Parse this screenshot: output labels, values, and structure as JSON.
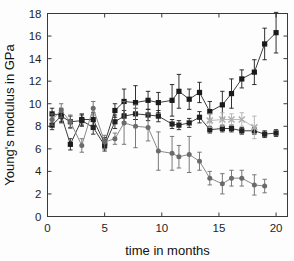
{
  "chart_data": {
    "type": "line",
    "title": "",
    "subtitle": "",
    "xlabel": "time in months",
    "ylabel": "Young's modulus in GPa",
    "xlim": [
      0,
      21
    ],
    "ylim": [
      0,
      18
    ],
    "xticks": [
      0,
      5,
      10,
      15,
      20
    ],
    "yticks": [
      0,
      2,
      4,
      6,
      8,
      10,
      12,
      14,
      16,
      18
    ],
    "xtick_labels": [
      "0",
      "5",
      "10",
      "15",
      "20"
    ],
    "ytick_labels": [
      "0",
      "2",
      "4",
      "6",
      "8",
      "10",
      "12",
      "14",
      "16",
      "18"
    ],
    "grid": false,
    "legend": "none",
    "error_bars": "symmetric vertical",
    "series": [
      {
        "name": "series-black-squares-upper",
        "marker": "square",
        "color": "#1a1a1a",
        "line_color": "#3d3d3d",
        "x": [
          0.4,
          1.2,
          2.0,
          3.0,
          4.0,
          5.0,
          5.9,
          6.7,
          7.7,
          8.8,
          9.7,
          10.9,
          11.5,
          12.4,
          13.3,
          14.2,
          15.3,
          16.1,
          17.0,
          18.1,
          19.0,
          20.0
        ],
        "y": [
          9.1,
          9.0,
          6.4,
          8.6,
          8.6,
          6.5,
          9.4,
          10.2,
          10.1,
          10.3,
          10.1,
          10.3,
          11.1,
          10.4,
          11.0,
          9.3,
          9.9,
          10.9,
          12.2,
          12.8,
          15.3,
          16.3
        ],
        "yerr": [
          0.5,
          0.6,
          0.5,
          0.5,
          0.6,
          0.5,
          0.6,
          1.1,
          1.5,
          0.8,
          0.9,
          1.4,
          1.5,
          0.9,
          0.9,
          0.9,
          1.2,
          1.3,
          0.8,
          1.1,
          1.4,
          1.8
        ]
      },
      {
        "name": "series-black-squares-flat",
        "marker": "square",
        "color": "#222222",
        "line_color": "#3d3d3d",
        "x": [
          0.4,
          1.2,
          2.0,
          3.0,
          4.0,
          5.0,
          5.9,
          6.7,
          7.7,
          8.8,
          9.7,
          10.9,
          11.5,
          12.4,
          13.3,
          14.2,
          15.3,
          16.1,
          17.0,
          18.1,
          19.0,
          20.0
        ],
        "y": [
          8.1,
          8.9,
          8.4,
          8.5,
          7.9,
          6.3,
          8.4,
          8.9,
          9.1,
          9.0,
          8.9,
          8.2,
          8.1,
          8.3,
          8.8,
          7.7,
          7.8,
          7.8,
          7.6,
          7.6,
          7.3,
          7.4
        ],
        "yerr": [
          0.4,
          0.6,
          0.5,
          0.5,
          0.6,
          0.5,
          0.6,
          0.5,
          0.5,
          0.5,
          0.5,
          0.4,
          0.4,
          0.4,
          0.5,
          0.3,
          0.3,
          0.3,
          0.3,
          0.3,
          0.3,
          0.3
        ]
      },
      {
        "name": "series-gray-circles-descending",
        "marker": "circle",
        "color": "#6b6b6b",
        "line_color": "#8a8a8a",
        "x": [
          0.4,
          1.2,
          2.0,
          3.0,
          4.0,
          5.0,
          5.9,
          6.7,
          7.7,
          8.8,
          9.7,
          10.9,
          11.5,
          12.4,
          13.3,
          14.2,
          15.3,
          16.1,
          17.0,
          18.1,
          19.0
        ],
        "y": [
          8.6,
          9.4,
          8.4,
          6.3,
          9.6,
          6.6,
          6.9,
          8.3,
          8.0,
          7.9,
          5.8,
          5.6,
          5.3,
          5.5,
          4.9,
          3.4,
          2.9,
          3.4,
          3.4,
          2.8,
          2.7
        ],
        "yerr": [
          0.5,
          0.6,
          0.6,
          0.6,
          0.6,
          0.6,
          0.5,
          1.9,
          1.9,
          1.2,
          1.7,
          1.5,
          1.0,
          1.6,
          0.8,
          0.6,
          0.9,
          0.7,
          0.7,
          0.9,
          0.6
        ]
      },
      {
        "name": "series-light-gray-crosses",
        "marker": "cross",
        "color": "#b0b0b0",
        "line_color": "#bdbdbd",
        "x": [
          14.2,
          15.3,
          16.1,
          17.0,
          18.1
        ],
        "y": [
          8.5,
          8.6,
          8.6,
          8.6,
          7.9
        ],
        "yerr": [
          0.6,
          0.6,
          0.5,
          0.6,
          1.0
        ]
      }
    ]
  },
  "axes": {
    "x_label": "time in months",
    "y_label": "Young's modulus in GPa"
  }
}
